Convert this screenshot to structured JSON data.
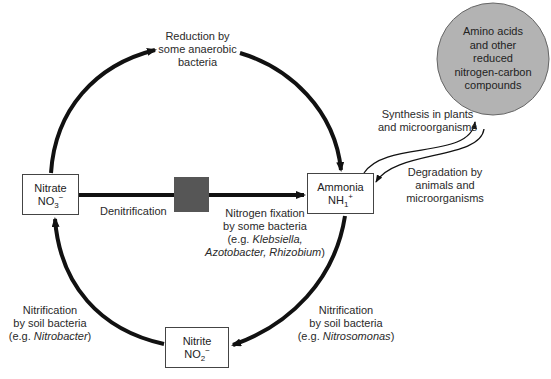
{
  "nodes": {
    "nitrate": {
      "name": "Nitrate",
      "formula": "NO",
      "sub": "3",
      "sup": "−"
    },
    "ammonia": {
      "name": "Ammonia",
      "formula": "NH",
      "sub": "1",
      "sup": "+"
    },
    "nitrite": {
      "name": "Nitrite",
      "formula": "NO",
      "sub": "2",
      "sup": "−"
    },
    "compounds": {
      "lines": [
        "Amino acids",
        "and other",
        "reduced",
        "nitrogen-carbon",
        "compounds"
      ],
      "fill": "#b3b3b3"
    }
  },
  "labels": {
    "reduction": [
      "Reduction by",
      "some anaerobic",
      "bacteria"
    ],
    "denitrification": "Denitrification",
    "fixation": {
      "line1": "Nitrogen fixation",
      "line2": "by some bacteria",
      "line3_pre": "(e.g. ",
      "line3_it": "Klebsiella,",
      "line4_it": "Azotobacter, Rhizobium",
      "line4_post": ")"
    },
    "synthesis": [
      "Synthesis in plants",
      "and microorganisms"
    ],
    "degradation": [
      "Degradation by",
      "animals and",
      "microorganisms"
    ],
    "nitrification_right": {
      "line1": "Nitrification",
      "line2": "by soil bacteria",
      "pre": "(e.g. ",
      "it": "Nitrosomonas",
      "post": ")"
    },
    "nitrification_left": {
      "line1": "Nitrification",
      "line2": "by soil bacteria",
      "pre": "(e.g. ",
      "it": "Nitrobacter",
      "post": ")"
    }
  },
  "colors": {
    "arrow": "#111111",
    "block": "#565656",
    "circle": "#b3b3b3"
  }
}
